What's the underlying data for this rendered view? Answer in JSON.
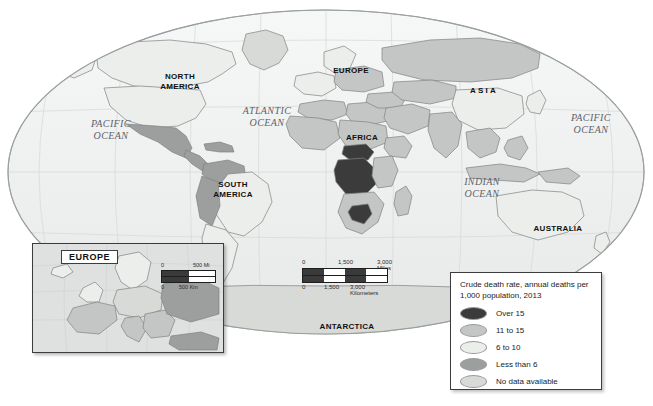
{
  "map": {
    "projection_name": "world-ellipse",
    "continent_labels": [
      {
        "name": "north-america",
        "text": "NORTH\nAMERICA",
        "x": 152,
        "y": 72,
        "w": 56,
        "wide": false
      },
      {
        "name": "south-america",
        "text": "SOUTH\nAMERICA",
        "x": 205,
        "y": 180,
        "w": 56,
        "wide": false
      },
      {
        "name": "europe",
        "text": "EUROPE",
        "x": 327,
        "y": 66,
        "w": 48,
        "wide": false
      },
      {
        "name": "africa",
        "text": "AFRICA",
        "x": 340,
        "y": 133,
        "w": 44,
        "wide": false
      },
      {
        "name": "asia",
        "text": "ASIA",
        "x": 460,
        "y": 86,
        "w": 48,
        "wide": true
      },
      {
        "name": "australia",
        "text": "AUSTRALIA",
        "x": 530,
        "y": 224,
        "w": 56,
        "wide": false
      },
      {
        "name": "antarctica",
        "text": "ANTARCTICA",
        "x": 315,
        "y": 322,
        "w": 64,
        "wide": false
      }
    ],
    "ocean_labels": [
      {
        "name": "pacific-ocean-west",
        "text": "PACIFIC\nOCEAN",
        "x": 80,
        "y": 118,
        "w": 62
      },
      {
        "name": "atlantic-ocean",
        "text": "ATLANTIC\nOCEAN",
        "x": 232,
        "y": 105,
        "w": 70
      },
      {
        "name": "indian-ocean",
        "text": "INDIAN\nOCEAN",
        "x": 452,
        "y": 176,
        "w": 60
      },
      {
        "name": "pacific-ocean-east",
        "text": "PACIFIC\nOCEAN",
        "x": 560,
        "y": 112,
        "w": 62
      }
    ],
    "scale_bar": {
      "miles": {
        "start": "0",
        "mid": "1,500",
        "end": "3,000 Miles"
      },
      "kilometers": {
        "start": "0",
        "mid": "1,500",
        "end": "3,000 Kilometers"
      }
    }
  },
  "europe_inset": {
    "title": "EUROPE",
    "scale_bar": {
      "miles": {
        "start": "0",
        "end": "500 Mi"
      },
      "kilometers": {
        "start": "0",
        "end": "500 Km"
      }
    }
  },
  "legend": {
    "title": "Crude death rate, annual deaths per 1,000 population, 2013",
    "items": [
      {
        "label": "Over 15",
        "color": "#3b3b3b"
      },
      {
        "label": "11 to 15",
        "color": "#c3c6c4"
      },
      {
        "label": "6 to 10",
        "color": "#eceeec"
      },
      {
        "label": "Less than 6",
        "color": "#9c9f9e"
      },
      {
        "label": "No data available",
        "color": "#d8dad8"
      }
    ]
  },
  "colors": {
    "ocean": "#f2f3f3",
    "ocean_inset": "#dfe1e1",
    "outline": "#8d9190",
    "frame": "#3c3c3c",
    "over15": "#3b3b3b",
    "r11_15": "#c3c6c4",
    "r6_10": "#eceeec",
    "less6": "#9c9f9e",
    "nodata": "#d8dad8"
  }
}
